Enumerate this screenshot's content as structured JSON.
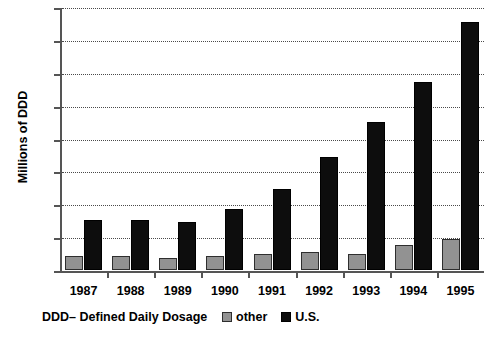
{
  "chart_data": {
    "type": "bar",
    "title": "",
    "xlabel": "",
    "ylabel": "Millions of DDD",
    "categories": [
      "1987",
      "1988",
      "1989",
      "1990",
      "1991",
      "1992",
      "1993",
      "1994",
      "1995"
    ],
    "series": [
      {
        "name": "other",
        "color": "#929292",
        "values": [
          17,
          17,
          15,
          17,
          20,
          22,
          20,
          31,
          38
        ]
      },
      {
        "name": "U.S.",
        "color": "#0d0d0d",
        "values": [
          61,
          61,
          59,
          74,
          98,
          138,
          180,
          229,
          302
        ]
      }
    ],
    "ylim": [
      0,
      320
    ],
    "yticks": [
      0,
      40,
      80,
      120,
      160,
      200,
      240,
      280,
      320
    ],
    "ytick_labels": [
      "0",
      "40",
      "80",
      "120",
      "160",
      "200",
      "240",
      "280",
      "320"
    ],
    "grid": true,
    "legend_position": "bottom-center"
  },
  "footer": {
    "note": "DDD– Defined Daily Dosage"
  },
  "legend": {
    "entries": [
      {
        "label": "other"
      },
      {
        "label": "U.S."
      }
    ]
  }
}
